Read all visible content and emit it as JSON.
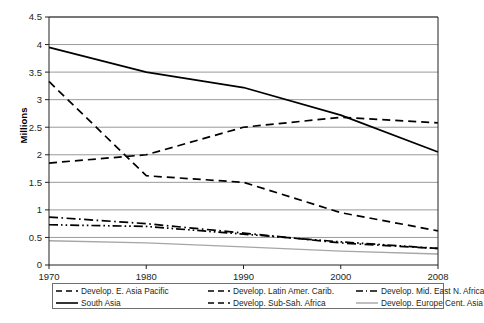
{
  "chart_data": {
    "type": "line",
    "title": "",
    "xlabel": "",
    "ylabel": "Millions",
    "x": [
      1970,
      1980,
      1990,
      2000,
      2008
    ],
    "xtick_labels": [
      "1970",
      "1980",
      "1990",
      "2000",
      "2008"
    ],
    "ylim": [
      0,
      4.5
    ],
    "ytick_values": [
      0,
      0.5,
      1,
      1.5,
      2,
      2.5,
      3,
      3.5,
      4,
      4.5
    ],
    "ytick_labels": [
      "0",
      "0.5",
      "1",
      "1.5",
      "2",
      "2.5",
      "3",
      "3.5",
      "4",
      "4.5"
    ],
    "grid": "horizontal",
    "legend_position": "bottom",
    "series": [
      {
        "name": "Develop. E. Asia Pacific",
        "style": "dashed",
        "color": "#000000",
        "values": [
          1.85,
          2.0,
          2.5,
          2.68,
          2.58
        ]
      },
      {
        "name": "Develop. Latin Amer. Carib.",
        "style": "dashed",
        "color": "#000000",
        "values": [
          3.33,
          1.62,
          1.5,
          0.95,
          0.62
        ]
      },
      {
        "name": "Develop. Mid. East N. Africa",
        "style": "dash-dot",
        "color": "#000000",
        "values": [
          0.87,
          0.75,
          0.58,
          0.4,
          0.3
        ]
      },
      {
        "name": "South Asia",
        "style": "solid",
        "color": "#000000",
        "values": [
          3.95,
          3.5,
          3.22,
          2.72,
          2.05
        ]
      },
      {
        "name": "Develop. Sub-Sah. Africa",
        "style": "dash-dot-dot",
        "color": "#000000",
        "values": [
          0.73,
          0.7,
          0.56,
          0.42,
          0.3
        ]
      },
      {
        "name": "Develop. Europe Cent. Asia",
        "style": "solid-thin",
        "color": "#a6a6a6",
        "values": [
          0.44,
          0.4,
          0.33,
          0.25,
          0.2
        ]
      }
    ]
  },
  "axis": {
    "y_title": "Millions",
    "y_ticks": [
      "4.5",
      "4",
      "3.5",
      "3",
      "2.5",
      "2",
      "1.5",
      "1",
      "0.5",
      "0"
    ],
    "x_ticks": [
      "1970",
      "1980",
      "1990",
      "2000",
      "2008"
    ]
  },
  "legend": {
    "row1": [
      "Develop. E. Asia Pacific",
      "Develop. Latin Amer. Carib.",
      "Develop. Mid. East N. Africa"
    ],
    "row2": [
      "South Asia",
      "Develop. Sub-Sah. Africa",
      "Develop. Europe Cent. Asia"
    ]
  },
  "caption": {
    "text": ""
  },
  "colors": {
    "line": "#000000",
    "grid": "#808080",
    "axis": "#231f20",
    "europe_series": "#a6a6a6",
    "legend_border": "#6f6f6f"
  }
}
